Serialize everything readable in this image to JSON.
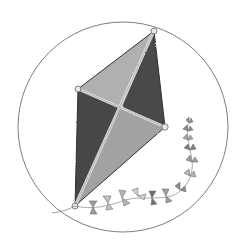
{
  "illustration": {
    "subject": "kite",
    "style": "pencil and grey watercolor sketch",
    "background": "#ffffff",
    "frame": {
      "shape": "circle",
      "cx": 123,
      "cy": 127,
      "r": 105,
      "stroke": "#6f6f6f"
    },
    "kite": {
      "vertices": {
        "top": [
          154,
          31
        ],
        "left": [
          78,
          89
        ],
        "right": [
          165,
          127
        ],
        "bottom": [
          75,
          206
        ]
      },
      "cross": [
        122,
        107
      ],
      "panel_colors": {
        "light": "#a8a8a8",
        "dark": "#4e4e4e"
      },
      "spar_color": "#d9d9d9"
    },
    "tail": {
      "bows": 13,
      "color": "#8a8a8a"
    }
  }
}
